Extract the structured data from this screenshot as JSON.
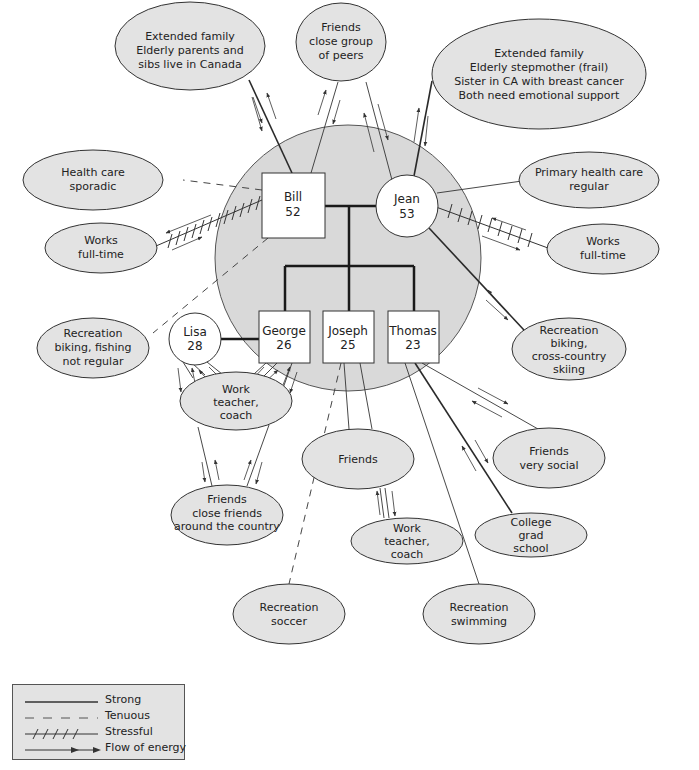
{
  "diagram": {
    "type": "ecomap",
    "household": {
      "cx": 348,
      "cy": 258,
      "r": 133
    },
    "family_members": [
      {
        "id": "bill",
        "name": "Bill",
        "age": "52",
        "shape": "square",
        "x": 262,
        "y": 173,
        "w": 63,
        "h": 65
      },
      {
        "id": "jean",
        "name": "Jean",
        "age": "53",
        "shape": "circle",
        "cx": 407,
        "cy": 206,
        "r": 31
      },
      {
        "id": "george",
        "name": "George",
        "age": "26",
        "shape": "square",
        "x": 259,
        "y": 311,
        "w": 51,
        "h": 52
      },
      {
        "id": "joseph",
        "name": "Joseph",
        "age": "25",
        "shape": "square",
        "x": 323,
        "y": 311,
        "w": 51,
        "h": 52
      },
      {
        "id": "thomas",
        "name": "Thomas",
        "age": "23",
        "shape": "square",
        "x": 388,
        "y": 311,
        "w": 51,
        "h": 52
      },
      {
        "id": "lisa",
        "name": "Lisa",
        "age": "28",
        "shape": "circle",
        "cx": 195,
        "cy": 339,
        "r": 26
      }
    ],
    "resources": [
      {
        "id": "extended-family-bill",
        "lines": [
          "Extended family",
          "Elderly parents and",
          "sibs live in Canada"
        ],
        "cx": 190,
        "cy": 46,
        "rx": 75,
        "ry": 44
      },
      {
        "id": "friends-peers",
        "lines": [
          "Friends",
          "close group",
          "of peers"
        ],
        "cx": 341,
        "cy": 42,
        "rx": 45,
        "ry": 39
      },
      {
        "id": "extended-family-jean",
        "lines": [
          "Extended family",
          "Elderly stepmother (frail)",
          "Sister in CA with breast cancer",
          "Both need emotional support"
        ],
        "cx": 539,
        "cy": 74,
        "rx": 107,
        "ry": 55
      },
      {
        "id": "health-care-sporadic",
        "lines": [
          "Health care",
          "sporadic"
        ],
        "cx": 93,
        "cy": 180,
        "rx": 70,
        "ry": 30
      },
      {
        "id": "primary-health-care",
        "lines": [
          "Primary health care",
          "regular"
        ],
        "cx": 589,
        "cy": 180,
        "rx": 70,
        "ry": 28
      },
      {
        "id": "works-bill",
        "lines": [
          "Works",
          "full-time"
        ],
        "cx": 101,
        "cy": 248,
        "rx": 56,
        "ry": 25
      },
      {
        "id": "works-jean",
        "lines": [
          "Works",
          "full-time"
        ],
        "cx": 603,
        "cy": 249,
        "rx": 56,
        "ry": 25
      },
      {
        "id": "recreation-bill",
        "lines": [
          "Recreation",
          "biking, fishing",
          "not regular"
        ],
        "cx": 93,
        "cy": 348,
        "rx": 56,
        "ry": 30
      },
      {
        "id": "recreation-jean",
        "lines": [
          "Recreation",
          "biking,",
          "cross-country",
          "skiing"
        ],
        "cx": 569,
        "cy": 349,
        "rx": 57,
        "ry": 31
      },
      {
        "id": "work-george-lisa",
        "lines": [
          "Work",
          "teacher,",
          "coach"
        ],
        "cx": 236,
        "cy": 401,
        "rx": 56,
        "ry": 29
      },
      {
        "id": "friends-joseph",
        "lines": [
          "Friends"
        ],
        "cx": 358,
        "cy": 459,
        "rx": 56,
        "ry": 30
      },
      {
        "id": "friends-thomas",
        "lines": [
          "Friends",
          "very social"
        ],
        "cx": 549,
        "cy": 458,
        "rx": 56,
        "ry": 30
      },
      {
        "id": "friends-george-lisa",
        "lines": [
          "Friends",
          "close friends",
          "around the country"
        ],
        "cx": 227,
        "cy": 515,
        "rx": 56,
        "ry": 30
      },
      {
        "id": "work-joseph",
        "lines": [
          "Work",
          "teacher,",
          "coach"
        ],
        "cx": 407,
        "cy": 541,
        "rx": 56,
        "ry": 23
      },
      {
        "id": "college-thomas",
        "lines": [
          "College",
          "grad",
          "school"
        ],
        "cx": 531,
        "cy": 535,
        "rx": 56,
        "ry": 22
      },
      {
        "id": "recreation-soccer",
        "lines": [
          "Recreation",
          "soccer"
        ],
        "cx": 289,
        "cy": 614,
        "rx": 56,
        "ry": 30
      },
      {
        "id": "recreation-swimming",
        "lines": [
          "Recreation",
          "swimming"
        ],
        "cx": 479,
        "cy": 614,
        "rx": 56,
        "ry": 30
      }
    ],
    "connections": [
      {
        "from": "bill",
        "to": "extended-family-bill",
        "type": "strong",
        "flow": "both"
      },
      {
        "from": "bill",
        "to": "friends-peers",
        "type": "normal",
        "flow": "both"
      },
      {
        "from": "jean",
        "to": "friends-peers",
        "type": "normal",
        "flow": "both"
      },
      {
        "from": "jean",
        "to": "extended-family-jean",
        "type": "strong",
        "flow": "both"
      },
      {
        "from": "bill",
        "to": "health-care-sporadic",
        "type": "tenuous",
        "flow": "none"
      },
      {
        "from": "jean",
        "to": "primary-health-care",
        "type": "normal",
        "flow": "none"
      },
      {
        "from": "bill",
        "to": "works-bill",
        "type": "stressful",
        "flow": "both"
      },
      {
        "from": "jean",
        "to": "works-jean",
        "type": "stressful",
        "flow": "both"
      },
      {
        "from": "bill",
        "to": "recreation-bill",
        "type": "tenuous",
        "flow": "none"
      },
      {
        "from": "jean",
        "to": "recreation-jean",
        "type": "strong",
        "flow": "both"
      },
      {
        "from": "lisa",
        "to": "work-george-lisa",
        "type": "normal",
        "flow": "both"
      },
      {
        "from": "george",
        "to": "work-george-lisa",
        "type": "normal",
        "flow": "both"
      },
      {
        "from": "work-george-lisa",
        "to": "friends-george-lisa",
        "type": "normal",
        "flow": "both"
      },
      {
        "from": "joseph",
        "to": "friends-joseph",
        "type": "normal",
        "flow": "none"
      },
      {
        "from": "joseph",
        "to": "recreation-soccer",
        "type": "tenuous",
        "flow": "none"
      },
      {
        "from": "friends-joseph",
        "to": "work-joseph",
        "type": "normal",
        "flow": "both"
      },
      {
        "from": "thomas",
        "to": "friends-thomas",
        "type": "normal",
        "flow": "both"
      },
      {
        "from": "thomas",
        "to": "college-thomas",
        "type": "strong",
        "flow": "both"
      },
      {
        "from": "thomas",
        "to": "recreation-swimming",
        "type": "normal",
        "flow": "none"
      }
    ]
  },
  "legend": {
    "items": [
      {
        "key": "strong",
        "label": "Strong"
      },
      {
        "key": "tenuous",
        "label": "Tenuous"
      },
      {
        "key": "stressful",
        "label": "Stressful"
      },
      {
        "key": "flow",
        "label": "Flow of energy"
      }
    ]
  }
}
